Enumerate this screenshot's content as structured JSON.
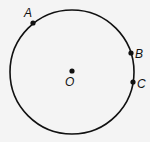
{
  "diagram": {
    "type": "circle",
    "stroke_color": "#111111",
    "background": "#f4f4f4",
    "circle": {
      "cx": 72,
      "cy": 72,
      "r": 62
    },
    "center": {
      "label": "O",
      "x": 72,
      "y": 71
    },
    "points": [
      {
        "label": "A",
        "x": 33,
        "y": 23,
        "label_x": 24,
        "label_y": 16
      },
      {
        "label": "B",
        "x": 131,
        "y": 53,
        "label_x": 136,
        "label_y": 57
      },
      {
        "label": "C",
        "x": 133,
        "y": 82,
        "label_x": 138,
        "label_y": 87
      }
    ]
  }
}
